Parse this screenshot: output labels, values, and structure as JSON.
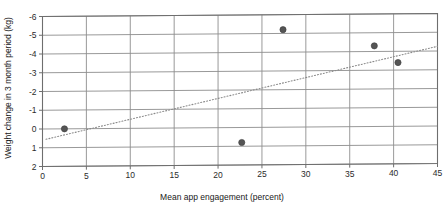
{
  "chart_data": {
    "type": "scatter",
    "title": "",
    "xlabel": "Mean app engagement (percent)",
    "ylabel": "Weight change in 3 month period (kg)",
    "xlim": [
      0,
      45
    ],
    "ylim": [
      2,
      -6
    ],
    "y_inverted": true,
    "grid": true,
    "legend": "none",
    "xticks": [
      0,
      5,
      10,
      15,
      20,
      25,
      30,
      35,
      40,
      45
    ],
    "yticks": [
      -6,
      -5,
      -4,
      -3,
      -2,
      -1,
      0,
      1,
      2
    ],
    "xtick_labels": [
      "0",
      "5",
      "10",
      "15",
      "20",
      "25",
      "30",
      "35",
      "40",
      "45"
    ],
    "ytick_labels": [
      "-6",
      "-5",
      "-4",
      "-3",
      "-2",
      "-1",
      "0",
      "1",
      "2"
    ],
    "series": [
      {
        "name": "observations",
        "marker": "filled-circle",
        "color": "#555555",
        "points": [
          {
            "x": 2.5,
            "y": 0.0
          },
          {
            "x": 22.7,
            "y": 0.8
          },
          {
            "x": 27.4,
            "y": -5.2
          },
          {
            "x": 37.8,
            "y": -4.3
          },
          {
            "x": 40.5,
            "y": -3.4
          }
        ]
      }
    ],
    "trendline": {
      "name": "linear fit",
      "style": "dotted",
      "color": "#8a8a8a",
      "x_start": 0.4,
      "y_start": 0.55,
      "x_end": 45.0,
      "y_end": -4.25
    }
  },
  "axis": {
    "x_title": "Mean app engagement (percent)",
    "y_title": "Weight change in 3 month period (kg)"
  }
}
